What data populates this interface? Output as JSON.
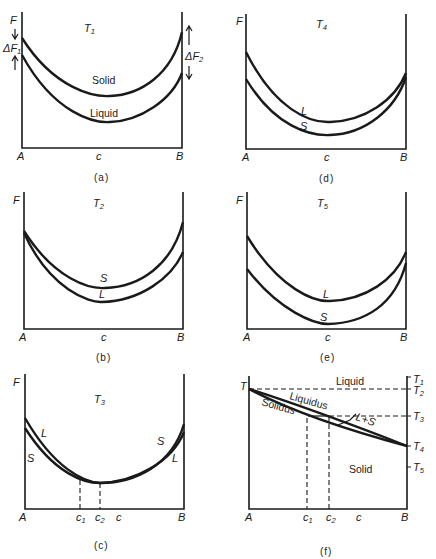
{
  "figure": {
    "panels": [
      {
        "id": "a",
        "caption": "(a)",
        "temperature": "T",
        "temperature_sub": "1",
        "y_axis": "F",
        "x_left": "A",
        "x_mid": "c",
        "x_right": "B",
        "curve_labels": {
          "upper": "Solid",
          "lower": "Liquid"
        },
        "annotations": {
          "left": "ΔF",
          "left_sub": "1",
          "right": "ΔF",
          "right_sub": "2"
        }
      },
      {
        "id": "b",
        "caption": "(b)",
        "temperature": "T",
        "temperature_sub": "2",
        "y_axis": "F",
        "x_left": "A",
        "x_mid": "c",
        "x_right": "B",
        "curve_labels": {
          "upper": "S",
          "lower": "L"
        }
      },
      {
        "id": "c",
        "caption": "(c)",
        "temperature": "T",
        "temperature_sub": "3",
        "y_axis": "F",
        "x_left": "A",
        "x_c1": "c",
        "x_c1_sub": "1",
        "x_c2": "c",
        "x_c2_sub": "2",
        "x_mid": "c",
        "x_right": "B",
        "curve_labels": {
          "left_upper": "L",
          "left_lower": "S",
          "right_upper": "S",
          "right_lower": "L"
        }
      },
      {
        "id": "d",
        "caption": "(d)",
        "temperature": "T",
        "temperature_sub": "4",
        "y_axis": "F",
        "x_left": "A",
        "x_mid": "c",
        "x_right": "B",
        "curve_labels": {
          "upper": "L",
          "lower": "S"
        }
      },
      {
        "id": "e",
        "caption": "(e)",
        "temperature": "T",
        "temperature_sub": "5",
        "y_axis": "F",
        "x_left": "A",
        "x_mid": "c",
        "x_right": "B",
        "curve_labels": {
          "upper": "L",
          "lower": "S"
        }
      },
      {
        "id": "f",
        "caption": "(f)",
        "y_axis": "T",
        "x_left": "A",
        "x_c1": "c",
        "x_c1_sub": "1",
        "x_c2": "c",
        "x_c2_sub": "2",
        "x_mid": "c",
        "x_right": "B",
        "region_labels": {
          "liquid": "Liquid",
          "solid": "Solid",
          "two_phase": "L+S"
        },
        "line_labels": {
          "liquidus": "Liquidus",
          "solidus": "Solidus"
        },
        "right_ticks": [
          {
            "label": "T",
            "sub": "1"
          },
          {
            "label": "T",
            "sub": "2"
          },
          {
            "label": "T",
            "sub": "3"
          },
          {
            "label": "T",
            "sub": "4"
          },
          {
            "label": "T",
            "sub": "5"
          }
        ]
      }
    ]
  }
}
